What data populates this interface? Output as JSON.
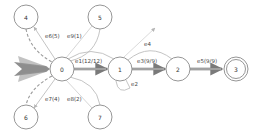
{
  "diagram": {
    "type": "state-transition-graph",
    "nodes": [
      {
        "id": "0",
        "label": "0",
        "x": 62,
        "y": 69,
        "r": 12,
        "final": false
      },
      {
        "id": "1",
        "label": "1",
        "x": 120,
        "y": 69,
        "r": 12,
        "final": false
      },
      {
        "id": "2",
        "label": "2",
        "x": 178,
        "y": 69,
        "r": 12,
        "final": false
      },
      {
        "id": "3",
        "label": "3",
        "x": 236,
        "y": 69,
        "r": 12,
        "final": true
      },
      {
        "id": "4",
        "label": "4",
        "x": 26,
        "y": 17,
        "r": 12,
        "final": false
      },
      {
        "id": "5",
        "label": "5",
        "x": 100,
        "y": 17,
        "r": 12,
        "final": false
      },
      {
        "id": "6",
        "label": "6",
        "x": 26,
        "y": 117,
        "r": 12,
        "final": false
      },
      {
        "id": "7",
        "label": "7",
        "x": 100,
        "y": 117,
        "r": 12,
        "final": false
      }
    ],
    "edges": [
      {
        "id": "e1",
        "label": "e1(12/12)",
        "from": "0",
        "to": "1"
      },
      {
        "id": "e2",
        "label": "e2",
        "from": "1",
        "to": "1"
      },
      {
        "id": "e3",
        "label": "e3(9/9)",
        "from": "1",
        "to": "2"
      },
      {
        "id": "e4",
        "label": "e4",
        "from": "2",
        "to": "0"
      },
      {
        "id": "e5",
        "label": "e5(9/9)",
        "from": "2",
        "to": "3"
      },
      {
        "id": "e6",
        "label": "e6(5)",
        "from": "0",
        "to": "4"
      },
      {
        "id": "e7",
        "label": "e7(4)",
        "from": "0",
        "to": "6"
      },
      {
        "id": "e8",
        "label": "e8(2)",
        "from": "7",
        "to": "0"
      },
      {
        "id": "e9",
        "label": "e9(1)",
        "from": "5",
        "to": "0"
      }
    ],
    "colors": {
      "node_stroke": "#8a8a8a",
      "edge_light": "#b5b5b5",
      "edge_dark": "#7a7a7a",
      "entry_arrow": "#6e6e6e"
    }
  }
}
